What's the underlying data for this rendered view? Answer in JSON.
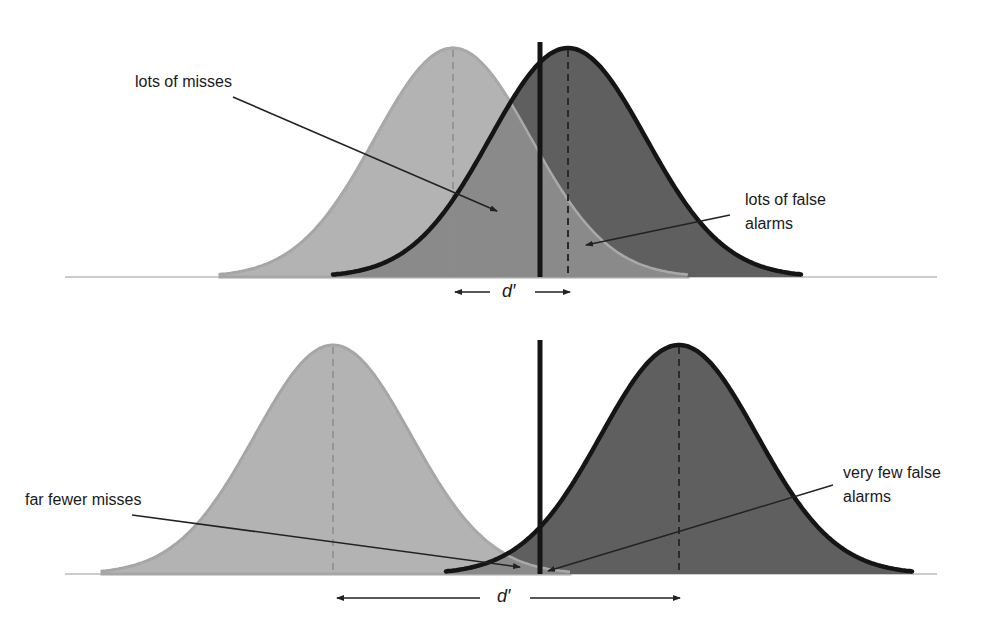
{
  "colors": {
    "background": "#ffffff",
    "noise_fill": "#b3b3b3",
    "noise_stroke": "#a6a6a6",
    "signal_fill": "#5f5f5f",
    "overlap_fill": "#8a8a8a",
    "outline": "#151515",
    "baseline": "#9a9a9a",
    "arrow": "#222222",
    "text": "#1a1a1a"
  },
  "panels": [
    {
      "id": "top",
      "baseline_y": 277,
      "baseline_x": [
        65,
        937
      ],
      "noise": {
        "mean_x": 453,
        "sd": 78,
        "peak_y": 48,
        "x_range": [
          220,
          688
        ]
      },
      "signal": {
        "mean_x": 568,
        "sd": 78,
        "peak_y": 48,
        "x_range": [
          333,
          802
        ]
      },
      "criterion": {
        "x": 540,
        "top_y": 42
      },
      "labels": [
        {
          "text": "lots of misses",
          "x": 135,
          "y": 70,
          "arrow": [
            233,
            97,
            497,
            211
          ]
        },
        {
          "text": "lots of false",
          "text2": "alarms",
          "x": 745,
          "y": 188,
          "arrow": [
            730,
            215,
            586,
            245
          ]
        }
      ],
      "dprime": {
        "text": "d′",
        "x": 502,
        "y": 282,
        "left_arrow": [
          490,
          455
        ],
        "right_arrow": [
          535,
          570
        ],
        "arrow_y": 292
      }
    },
    {
      "id": "bottom",
      "baseline_y": 574,
      "baseline_x": [
        65,
        937
      ],
      "noise": {
        "mean_x": 333,
        "sd": 78,
        "peak_y": 345,
        "x_range": [
          102,
          570
        ]
      },
      "signal": {
        "mean_x": 679,
        "sd": 78,
        "peak_y": 345,
        "x_range": [
          446,
          913
        ]
      },
      "criterion": {
        "x": 540,
        "top_y": 340
      },
      "labels": [
        {
          "text": "far fewer misses",
          "x": 25,
          "y": 488,
          "arrow": [
            132,
            515,
            520,
            567
          ]
        },
        {
          "text": "very few false",
          "text2": "alarms",
          "x": 843,
          "y": 461,
          "arrow": [
            833,
            485,
            548,
            571
          ]
        }
      ],
      "dprime": {
        "text": "d′",
        "x": 497,
        "y": 586,
        "left_arrow": [
          480,
          337
        ],
        "right_arrow": [
          530,
          680
        ],
        "arrow_y": 598
      }
    }
  ],
  "text": {
    "top_miss_label": "lots of misses",
    "top_fa_line1": "lots of false",
    "top_fa_line2": "alarms",
    "bottom_miss_label": "far fewer misses",
    "bottom_fa_line1": "very few false",
    "bottom_fa_line2": "alarms",
    "dprime": "d′"
  }
}
